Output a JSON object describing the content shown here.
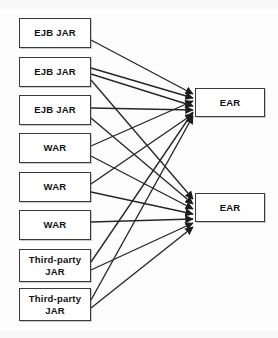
{
  "diagram": {
    "canvas": {
      "width": 278,
      "height": 338
    },
    "style": {
      "background": "#fdfdfd",
      "box_fill": "#ffffff",
      "box_stroke": "#3a3a3a",
      "edge_stroke": "#262626",
      "text_color": "#111111"
    },
    "sources": [
      {
        "id": "ejb1",
        "label": "EJB JAR",
        "x": 19,
        "y": 18,
        "w": 72,
        "h": 30
      },
      {
        "id": "ejb2",
        "label": "EJB JAR",
        "x": 19,
        "y": 57,
        "w": 72,
        "h": 30
      },
      {
        "id": "ejb3",
        "label": "EJB JAR",
        "x": 19,
        "y": 95,
        "w": 72,
        "h": 30
      },
      {
        "id": "war1",
        "label": "WAR",
        "x": 19,
        "y": 133,
        "w": 72,
        "h": 30
      },
      {
        "id": "war2",
        "label": "WAR",
        "x": 19,
        "y": 172,
        "w": 72,
        "h": 30
      },
      {
        "id": "war3",
        "label": "WAR",
        "x": 19,
        "y": 210,
        "w": 72,
        "h": 30
      },
      {
        "id": "tp1",
        "label": "Third-party JAR",
        "x": 19,
        "y": 249,
        "w": 72,
        "h": 33
      },
      {
        "id": "tp2",
        "label": "Third-party JAR",
        "x": 19,
        "y": 288,
        "w": 72,
        "h": 33
      }
    ],
    "targets": [
      {
        "id": "ear1",
        "label": "EAR",
        "x": 195,
        "y": 88,
        "w": 70,
        "h": 29
      },
      {
        "id": "ear2",
        "label": "EAR",
        "x": 195,
        "y": 193,
        "w": 70,
        "h": 29
      }
    ],
    "edges": [
      {
        "from": "ejb1",
        "to": "ear1",
        "x1": 91,
        "y1": 40,
        "x2": 193,
        "y2": 94
      },
      {
        "from": "ejb2",
        "to": "ear1",
        "x1": 91,
        "y1": 68,
        "x2": 193,
        "y2": 98
      },
      {
        "from": "ejb2",
        "to": "ear1",
        "x1": 91,
        "y1": 74,
        "x2": 193,
        "y2": 106
      },
      {
        "from": "ejb2",
        "to": "ear2",
        "x1": 91,
        "y1": 80,
        "x2": 193,
        "y2": 199
      },
      {
        "from": "ejb3",
        "to": "ear1",
        "x1": 91,
        "y1": 108,
        "x2": 193,
        "y2": 110
      },
      {
        "from": "ejb3",
        "to": "ear2",
        "x1": 91,
        "y1": 118,
        "x2": 193,
        "y2": 204
      },
      {
        "from": "war1",
        "to": "ear1",
        "x1": 91,
        "y1": 146,
        "x2": 193,
        "y2": 101
      },
      {
        "from": "war1",
        "to": "ear2",
        "x1": 91,
        "y1": 156,
        "x2": 193,
        "y2": 209
      },
      {
        "from": "war2",
        "to": "ear1",
        "x1": 91,
        "y1": 184,
        "x2": 193,
        "y2": 114
      },
      {
        "from": "war2",
        "to": "ear2",
        "x1": 91,
        "y1": 192,
        "x2": 193,
        "y2": 214
      },
      {
        "from": "war3",
        "to": "ear2",
        "x1": 91,
        "y1": 222,
        "x2": 193,
        "y2": 219
      },
      {
        "from": "tp1",
        "to": "ear1",
        "x1": 91,
        "y1": 262,
        "x2": 193,
        "y2": 112
      },
      {
        "from": "tp1",
        "to": "ear2",
        "x1": 91,
        "y1": 270,
        "x2": 193,
        "y2": 223
      },
      {
        "from": "tp2",
        "to": "ear1",
        "x1": 91,
        "y1": 300,
        "x2": 193,
        "y2": 116
      },
      {
        "from": "tp2",
        "to": "ear2",
        "x1": 91,
        "y1": 308,
        "x2": 193,
        "y2": 227
      }
    ]
  }
}
